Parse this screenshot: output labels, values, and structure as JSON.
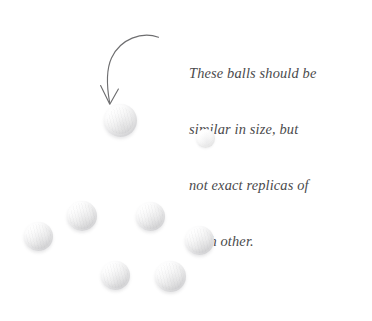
{
  "canvas": {
    "width": 372,
    "height": 321,
    "background_color": "#ffffff"
  },
  "annotation": {
    "name": "callout-note",
    "text_color": "#4a4a4c",
    "lines": [
      "These balls should be",
      "similar in size, but",
      "not exact replicas of",
      "each other."
    ],
    "full_text": "These balls should be similar in size, but not exact replicas of each other."
  },
  "arrow": {
    "name": "curved-pointer-arrow",
    "stroke_color": "#6e6e70",
    "start": {
      "x": 158,
      "y": 37
    },
    "end": {
      "x": 110,
      "y": 104
    },
    "head": "open-v",
    "direction": "down-left"
  },
  "balls": {
    "count": 8,
    "base_color": "#f2f2f2",
    "shadow_color": "#d3d3d4",
    "items": [
      {
        "label": "ball-top-large",
        "x": 104,
        "y": 104,
        "size": 33,
        "faint": false
      },
      {
        "label": "ball-top-small",
        "x": 196,
        "y": 129,
        "size": 19,
        "faint": true
      },
      {
        "label": "ball-cluster-left",
        "x": 24,
        "y": 222,
        "size": 29,
        "faint": false
      },
      {
        "label": "ball-cluster-upper-l",
        "x": 67,
        "y": 201,
        "size": 30,
        "faint": false
      },
      {
        "label": "ball-cluster-upper-r",
        "x": 136,
        "y": 202,
        "size": 29,
        "faint": false
      },
      {
        "label": "ball-cluster-right",
        "x": 185,
        "y": 226,
        "size": 29,
        "faint": false
      },
      {
        "label": "ball-cluster-lower-l",
        "x": 101,
        "y": 261,
        "size": 29,
        "faint": false
      },
      {
        "label": "ball-cluster-lower-r",
        "x": 155,
        "y": 261,
        "size": 31,
        "faint": false
      }
    ]
  }
}
